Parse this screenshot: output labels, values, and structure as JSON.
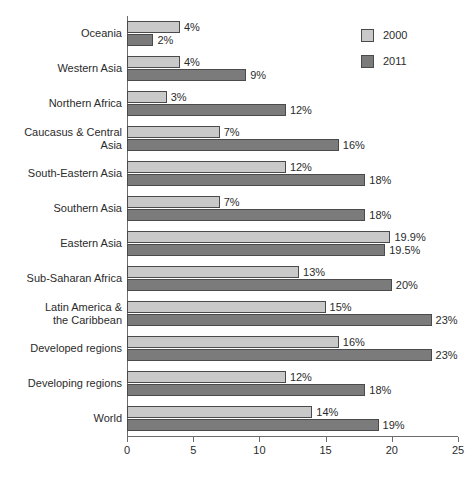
{
  "chart_data": {
    "type": "bar",
    "orientation": "horizontal",
    "title": "",
    "subtitle": "",
    "xlabel": "",
    "ylabel": "",
    "xlim": [
      0,
      25
    ],
    "xticks": [
      0,
      5,
      10,
      15,
      20,
      25
    ],
    "xtick_labels": [
      "0",
      "5",
      "10",
      "15",
      "20",
      "25"
    ],
    "grid": false,
    "legend_position": "top-right",
    "value_label_suffix": "%",
    "categories": [
      "Oceania",
      "Western Asia",
      "Northern Africa",
      "Caucasus & Central\nAsia",
      "South-Eastern Asia",
      "Southern Asia",
      "Eastern Asia",
      "Sub-Saharan Africa",
      "Latin America &\nthe Caribbean",
      "Developed regions",
      "Developing regions",
      "World"
    ],
    "series": [
      {
        "name": "2000",
        "color": "#c9c9c9",
        "values": [
          4,
          4,
          3,
          7,
          12,
          7,
          19.9,
          13,
          15,
          16,
          12,
          14
        ],
        "value_labels": [
          "4%",
          "4%",
          "3%",
          "7%",
          "12%",
          "7%",
          "19.9%",
          "13%",
          "15%",
          "16%",
          "12%",
          "14%"
        ]
      },
      {
        "name": "2011",
        "color": "#7b7b7b",
        "values": [
          2,
          9,
          12,
          16,
          18,
          18,
          19.5,
          20,
          23,
          23,
          18,
          19
        ],
        "value_labels": [
          "2%",
          "9%",
          "12%",
          "16%",
          "18%",
          "18%",
          "19.5%",
          "20%",
          "23%",
          "23%",
          "18%",
          "19%"
        ]
      }
    ]
  },
  "legend": {
    "items": [
      {
        "label": "2000",
        "color": "#c9c9c9"
      },
      {
        "label": "2011",
        "color": "#7b7b7b"
      }
    ]
  }
}
